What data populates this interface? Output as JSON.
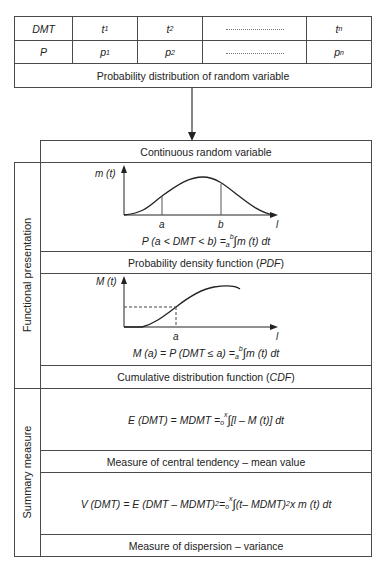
{
  "top_table": {
    "headers_row": {
      "label": "DMT",
      "cells": [
        {
          "base": "t",
          "sub": "1"
        },
        {
          "base": "t",
          "sub": "2"
        },
        {
          "base": "",
          "sub": "",
          "ellipsis": true
        },
        {
          "base": "t",
          "sub": "n"
        }
      ]
    },
    "values_row": {
      "label": "P",
      "cells": [
        {
          "base": "p",
          "sub": "1"
        },
        {
          "base": "p",
          "sub": "2"
        },
        {
          "base": "",
          "sub": "",
          "ellipsis": true
        },
        {
          "base": "p",
          "sub": "n"
        }
      ]
    },
    "caption": "Probability distribution of random variable"
  },
  "continuous_header": "Continuous random variable",
  "sections": [
    {
      "side_label": "Functional presentation",
      "rows": [
        {
          "type": "pdf-chart",
          "chart": {
            "y_label": "m (t)",
            "x_label": "l",
            "markers": [
              "a",
              "b"
            ]
          },
          "formula": {
            "lhs": "P (a < DMT < b) = ",
            "upper": "b",
            "lower": "a",
            "integral": "∫",
            "rhs": " m (t) dt"
          },
          "caption_pre": "Probability density function (",
          "caption_em": "PDF",
          "caption_post": ")"
        },
        {
          "type": "cdf-chart",
          "chart": {
            "y_label": "M (t)",
            "x_label": "l",
            "markers": [
              "a"
            ]
          },
          "formula": {
            "lhs": "M (a) = P (DMT ≤ a) = ",
            "upper": "b",
            "lower": "a",
            "integral": "∫",
            "rhs": " m (t) dt"
          },
          "caption_pre": "Cumulative distribution function (",
          "caption_em": "CDF",
          "caption_post": ")"
        }
      ]
    },
    {
      "side_label": "Summary measure",
      "rows": [
        {
          "type": "formula",
          "formula": {
            "lhs": "E (DMT) = MDMT = ",
            "upper": "x",
            "lower": "o",
            "integral": "∫",
            "rhs": " [l – M (t)] dt"
          },
          "caption": "Measure of central tendency – mean value"
        },
        {
          "type": "formula",
          "formula": {
            "lhs": "V (DMT) = E (DMT – MDMT)",
            "lhs_sup": "2",
            "lhs_eq": " = ",
            "upper": "x",
            "lower": "o",
            "integral": "∫",
            "rhs": " (t– MDMT)",
            "rhs_sup": "2",
            "rhs_tail": " x m (t) dt"
          },
          "caption": "Measure of dispersion – variance"
        }
      ]
    }
  ],
  "colors": {
    "line": "#4a4a4a",
    "text": "#222222",
    "background": "#ffffff"
  }
}
